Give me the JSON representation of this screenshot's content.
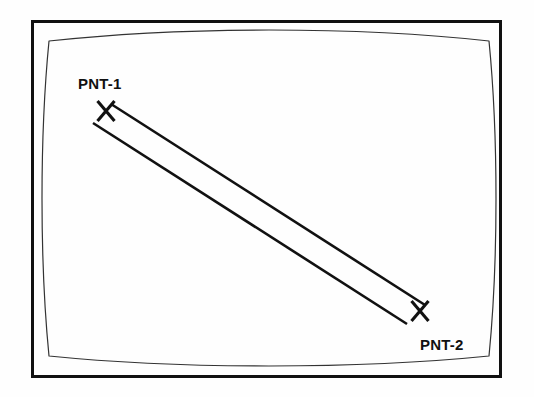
{
  "figure": {
    "name": "two-point-sighting-diagram",
    "background_color": "#fefefe",
    "stroke_color": "#111111",
    "outer_frame": {
      "name": "outer-frame",
      "x": 31,
      "y": 20,
      "width": 471,
      "height": 358,
      "stroke_width": 3
    },
    "screen_outline": {
      "name": "crt-screen-outline",
      "description": "barrel-curved rounded rectangle resembling a CRT display bezel",
      "stroke_width": 1.2,
      "corners": {
        "top_left": [
          49,
          41
        ],
        "top_right": [
          489,
          41
        ],
        "bottom_right": [
          489,
          356
        ],
        "bottom_left": [
          49,
          356
        ]
      },
      "bow": {
        "top_center_y": 30,
        "bottom_center_y": 366,
        "left_center_x": 42,
        "right_center_x": 496
      }
    },
    "markers": [
      {
        "name": "marker-pnt-1",
        "id": "PNT-1",
        "label": "PNT-1",
        "center_x": 106,
        "center_y": 111,
        "glyph": "x-marker",
        "label_x": 78,
        "label_y": 89,
        "label_anchor": "start"
      },
      {
        "name": "marker-pnt-2",
        "id": "PNT-2",
        "label": "PNT-2",
        "center_x": 420,
        "center_y": 311,
        "glyph": "x-marker",
        "label_x": 420,
        "label_y": 350,
        "label_anchor": "start"
      }
    ],
    "connector": {
      "name": "sight-line-band",
      "description": "pair of parallel lines forming an elongated band between PNT-1 and PNT-2",
      "stroke_width": 2.6,
      "line_upper": {
        "x1": 111,
        "y1": 104,
        "x2": 425,
        "y2": 305
      },
      "line_lower": {
        "x1": 93,
        "y1": 123,
        "x2": 407,
        "y2": 324
      },
      "separation_px": 11
    }
  }
}
